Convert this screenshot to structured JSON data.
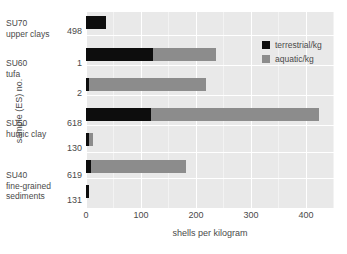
{
  "chart_data": {
    "type": "bar",
    "orientation": "horizontal",
    "stacked": true,
    "title": "",
    "xlabel": "shells per kilogram",
    "ylabel": "sample (ES) no.",
    "xlim": [
      0,
      450
    ],
    "xticks": [
      0,
      100,
      200,
      300,
      400
    ],
    "xtick_labels": [
      "0",
      "100",
      "200",
      "300",
      "400"
    ],
    "grid": "white gridlines on grey panel",
    "legend_position": "upper right inside panel",
    "categories": [
      "498",
      "1",
      "2",
      "618",
      "130",
      "619",
      "131"
    ],
    "series": [
      {
        "name": "terrestrial/kg",
        "color": "#0d0d0d",
        "values": [
          37,
          122,
          5,
          118,
          6,
          9,
          6
        ]
      },
      {
        "name": "aquatic/kg",
        "color": "#8c8c8c",
        "values": [
          0,
          114,
          213,
          304,
          7,
          173,
          0
        ]
      }
    ],
    "totals": [
      37,
      236,
      218,
      422,
      13,
      182,
      6
    ],
    "group_labels": [
      {
        "lines": [
          "SU70",
          "upper clays"
        ],
        "categories": [
          "498"
        ]
      },
      {
        "lines": [
          "SU60",
          "tufa"
        ],
        "categories": [
          "1"
        ]
      },
      {
        "lines": [
          "SU50",
          "humic clay"
        ],
        "categories": [
          "2",
          "618",
          "130"
        ]
      },
      {
        "lines": [
          "SU40",
          "fine-grained",
          "sediments"
        ],
        "categories": [
          "619",
          "131"
        ]
      }
    ]
  },
  "legend": {
    "items": [
      {
        "label": "terrestrial/kg",
        "color": "#0d0d0d"
      },
      {
        "label": "aquatic/kg",
        "color": "#8c8c8c"
      }
    ]
  },
  "axes": {
    "x_title": "shells per kilogram",
    "y_title": "sample (ES) no.",
    "x_tick_labels": [
      "0",
      "100",
      "200",
      "300",
      "400"
    ],
    "y_tick_labels": [
      "498",
      "1",
      "2",
      "618",
      "130",
      "619",
      "131"
    ]
  },
  "groups": [
    {
      "line1": "SU70",
      "line2": "upper clays",
      "line3": ""
    },
    {
      "line1": "SU60",
      "line2": "tufa",
      "line3": ""
    },
    {
      "line1": "SU50",
      "line2": "humic clay",
      "line3": ""
    },
    {
      "line1": "SU40",
      "line2": "fine-grained",
      "line3": "sediments"
    }
  ]
}
